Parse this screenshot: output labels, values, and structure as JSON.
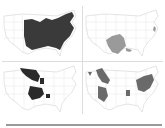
{
  "figure": {
    "caption_partial": "",
    "panels": [
      {
        "id": "a",
        "description": "Eastern US range, dark fill",
        "fill": "#3a3a3a"
      },
      {
        "id": "b",
        "description": "Texas / southern plains range, light gray fill",
        "fill": "#9a9a9a"
      },
      {
        "id": "c",
        "description": "Upper Midwest and Ozark patches, black fill",
        "fill": "#2a2a2a"
      },
      {
        "id": "d",
        "description": "Scattered western and Ohio Valley ranges, gray fill",
        "fill": "#6a6a6a"
      }
    ],
    "outline_color": "#c8c8c8",
    "rule_color": "#9a9a9a"
  }
}
